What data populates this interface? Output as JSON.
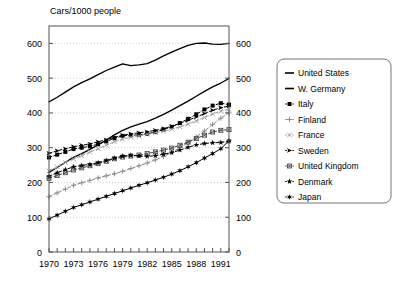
{
  "chart_data": {
    "type": "line",
    "title": "Cars/1000 people",
    "xlabel": "",
    "ylabel": "",
    "xlim": [
      1970,
      1992
    ],
    "ylim": [
      0,
      650
    ],
    "grid": true,
    "legend_position": "right",
    "x_ticks": [
      1970,
      1973,
      1976,
      1979,
      1982,
      1985,
      1988,
      1991
    ],
    "x_minor_tick_step": 1,
    "y_ticks": [
      0,
      100,
      200,
      300,
      400,
      500,
      600
    ],
    "y_axis_left_labels": [
      "600",
      "500",
      "400",
      "300",
      "200",
      "100",
      "0"
    ],
    "y_axis_right_labels": [
      "600",
      "500",
      "400",
      "300",
      "200",
      "100",
      "0"
    ],
    "x": [
      1970,
      1971,
      1972,
      1973,
      1974,
      1975,
      1976,
      1977,
      1978,
      1979,
      1980,
      1981,
      1982,
      1983,
      1984,
      1985,
      1986,
      1987,
      1988,
      1989,
      1990,
      1991,
      1992
    ],
    "series": [
      {
        "name": "United States",
        "marker": "none",
        "line": "solid",
        "color": "#000000",
        "values": [
          432,
          445,
          460,
          475,
          487,
          498,
          510,
          522,
          532,
          541,
          536,
          538,
          542,
          552,
          564,
          575,
          585,
          594,
          600,
          601,
          598,
          597,
          600
        ]
      },
      {
        "name": "W. Germany",
        "marker": "none",
        "line": "solid",
        "color": "#000000",
        "values": [
          229,
          243,
          258,
          272,
          283,
          295,
          308,
          322,
          337,
          350,
          360,
          368,
          375,
          385,
          396,
          408,
          421,
          434,
          448,
          462,
          475,
          486,
          499
        ]
      },
      {
        "name": "Italy",
        "marker": "square",
        "line": "dashed",
        "color": "#000000",
        "values": [
          272,
          280,
          288,
          296,
          300,
          304,
          310,
          318,
          327,
          334,
          336,
          337,
          340,
          345,
          352,
          360,
          371,
          383,
          396,
          410,
          421,
          428,
          424
        ]
      },
      {
        "name": "Finland",
        "marker": "plus",
        "line": "dashed",
        "color": "#888888",
        "values": [
          159,
          170,
          181,
          192,
          199,
          206,
          213,
          219,
          225,
          232,
          240,
          248,
          256,
          265,
          275,
          286,
          300,
          315,
          331,
          348,
          367,
          385,
          400
        ]
      },
      {
        "name": "France",
        "marker": "cross",
        "line": "dashed",
        "color": "#999999",
        "values": [
          233,
          245,
          257,
          268,
          277,
          287,
          297,
          307,
          317,
          325,
          330,
          334,
          339,
          343,
          348,
          353,
          360,
          368,
          377,
          387,
          397,
          405,
          410
        ]
      },
      {
        "name": "Sweden",
        "marker": "arrow",
        "line": "dashed",
        "color": "#000000",
        "values": [
          284,
          291,
          297,
          303,
          307,
          311,
          317,
          323,
          330,
          336,
          340,
          343,
          346,
          350,
          355,
          362,
          370,
          379,
          388,
          398,
          408,
          415,
          420
        ]
      },
      {
        "name": "United Kingdom",
        "marker": "x-box",
        "line": "dashed",
        "color": "#444444",
        "values": [
          212,
          220,
          228,
          236,
          242,
          248,
          254,
          261,
          268,
          273,
          276,
          279,
          283,
          288,
          293,
          299,
          307,
          316,
          326,
          336,
          345,
          350,
          352
        ]
      },
      {
        "name": "Denmark",
        "marker": "star",
        "line": "dashed",
        "color": "#000000",
        "values": [
          218,
          228,
          237,
          245,
          249,
          252,
          257,
          263,
          270,
          276,
          278,
          276,
          275,
          277,
          281,
          286,
          293,
          301,
          308,
          312,
          314,
          315,
          318
        ]
      },
      {
        "name": "Japan",
        "marker": "star6",
        "line": "solid-marker",
        "color": "#000000",
        "values": [
          95,
          106,
          117,
          128,
          136,
          144,
          152,
          160,
          168,
          176,
          184,
          192,
          199,
          207,
          215,
          224,
          234,
          245,
          257,
          270,
          283,
          297,
          320
        ]
      }
    ]
  },
  "legend": {
    "items": [
      {
        "label": "United States"
      },
      {
        "label": "W. Germany"
      },
      {
        "label": "Italy"
      },
      {
        "label": "Finland"
      },
      {
        "label": "France"
      },
      {
        "label": "Sweden"
      },
      {
        "label": "United Kingdom"
      },
      {
        "label": "Denmark"
      },
      {
        "label": "Japan"
      }
    ]
  }
}
